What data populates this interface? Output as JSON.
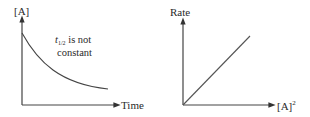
{
  "diagrams": [
    {
      "id": "concentration-vs-time",
      "y_axis_label": "[A]",
      "x_axis_label": "Time",
      "annotation": {
        "line1_var": "t",
        "line1_sub": "1/2",
        "line1_rest": " is not",
        "line2": "constant"
      },
      "curve_type": "exponential-like decay"
    },
    {
      "id": "rate-vs-concentration-squared",
      "y_axis_label": "Rate",
      "x_axis_label_base": "[A]",
      "x_axis_label_sup": "2",
      "curve_type": "straight line through origin"
    }
  ],
  "colors": {
    "line": "#444444",
    "text": "#2a2a2a",
    "background": "#ffffff"
  }
}
